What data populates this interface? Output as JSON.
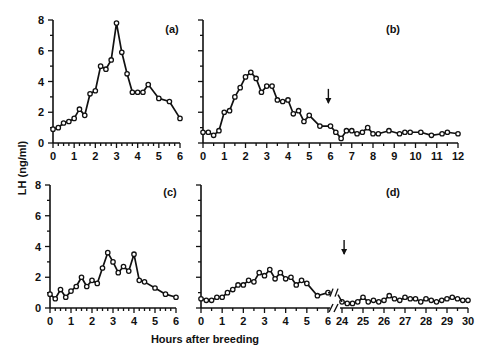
{
  "figure": {
    "ylabel": "LH (ng/ml)",
    "xlabel": "Hours after breeding"
  },
  "chart_data": [
    {
      "panel": "(a)",
      "type": "line",
      "title": "(a)",
      "xlabel": "Hours after breeding",
      "ylabel": "LH (ng/ml)",
      "xlim": [
        0,
        6
      ],
      "ylim": [
        0,
        8
      ],
      "xticks": [
        0,
        1,
        2,
        3,
        4,
        5,
        6
      ],
      "yticks": [
        0,
        2,
        4,
        6,
        8
      ],
      "x": [
        0,
        0.25,
        0.5,
        0.75,
        1,
        1.25,
        1.5,
        1.75,
        2,
        2.25,
        2.5,
        2.75,
        3,
        3.25,
        3.5,
        3.75,
        4,
        4.25,
        4.5,
        5,
        5.5,
        6
      ],
      "y": [
        0.9,
        1.0,
        1.3,
        1.4,
        1.6,
        2.2,
        1.8,
        3.2,
        3.4,
        5.0,
        4.8,
        5.4,
        7.8,
        5.9,
        4.5,
        3.3,
        3.3,
        3.3,
        3.8,
        2.9,
        2.7,
        1.6
      ]
    },
    {
      "panel": "(b)",
      "type": "line",
      "title": "(b)",
      "xlabel": "Hours after breeding",
      "ylabel": "LH (ng/ml)",
      "xlim": [
        0,
        12
      ],
      "ylim": [
        0,
        8
      ],
      "xticks": [
        0,
        1,
        2,
        3,
        4,
        5,
        6,
        7,
        8,
        9,
        10,
        11,
        12
      ],
      "yticks": [
        0,
        2,
        4,
        6,
        8
      ],
      "annotations": [
        {
          "type": "arrow-down",
          "x": 5.9,
          "y": 3.0
        }
      ],
      "x": [
        0,
        0.25,
        0.5,
        0.75,
        1,
        1.25,
        1.5,
        1.75,
        2,
        2.25,
        2.5,
        2.75,
        3,
        3.25,
        3.5,
        3.75,
        4,
        4.25,
        4.5,
        4.75,
        5,
        5.5,
        6,
        6.25,
        6.5,
        6.75,
        7,
        7.25,
        7.5,
        7.75,
        8,
        8.25,
        8.75,
        9.25,
        9.5,
        9.75,
        10.25,
        10.75,
        11.25,
        11.5,
        12
      ],
      "y": [
        0.7,
        0.7,
        0.5,
        0.8,
        2.0,
        2.1,
        3.0,
        3.6,
        4.3,
        4.6,
        4.2,
        3.3,
        3.7,
        3.7,
        2.8,
        2.7,
        2.8,
        1.9,
        2.1,
        1.4,
        1.8,
        1.1,
        1.1,
        0.7,
        0.3,
        0.8,
        0.8,
        0.6,
        0.7,
        1.0,
        0.6,
        0.6,
        0.8,
        0.6,
        0.7,
        0.7,
        0.7,
        0.5,
        0.6,
        0.7,
        0.6
      ]
    },
    {
      "panel": "(c)",
      "type": "line",
      "title": "(c)",
      "xlabel": "Hours after breeding",
      "ylabel": "LH (ng/ml)",
      "xlim": [
        0,
        6
      ],
      "ylim": [
        0,
        8
      ],
      "xticks": [
        0,
        1,
        2,
        3,
        4,
        5,
        6
      ],
      "yticks": [
        0,
        2,
        4,
        6,
        8
      ],
      "x": [
        0,
        0.25,
        0.5,
        0.75,
        1,
        1.25,
        1.5,
        1.75,
        2,
        2.25,
        2.5,
        2.75,
        3,
        3.25,
        3.5,
        3.75,
        4,
        4.25,
        4.5,
        5,
        5.5,
        6
      ],
      "y": [
        0.9,
        0.6,
        1.2,
        0.7,
        1.1,
        1.4,
        2.0,
        1.4,
        1.8,
        1.6,
        2.6,
        3.6,
        3.0,
        2.3,
        2.7,
        2.4,
        3.5,
        1.8,
        1.7,
        1.3,
        0.9,
        0.7
      ]
    },
    {
      "panel": "(d)",
      "type": "line",
      "title": "(d)",
      "xlabel": "Hours after breeding",
      "ylabel": "LH (ng/ml)",
      "xlim": [
        0,
        30
      ],
      "axis_break": [
        6,
        24
      ],
      "ylim": [
        0,
        8
      ],
      "xticks": [
        0,
        1,
        2,
        3,
        4,
        5,
        6,
        24,
        25,
        26,
        27,
        28,
        29,
        30
      ],
      "yticks": [
        0,
        2,
        4,
        6,
        8
      ],
      "annotations": [
        {
          "type": "arrow-down",
          "x": 24.1,
          "y": 3.9
        }
      ],
      "segments": [
        {
          "x": [
            0,
            0.25,
            0.5,
            0.75,
            1,
            1.25,
            1.5,
            1.75,
            2,
            2.25,
            2.5,
            2.75,
            3,
            3.25,
            3.5,
            3.75,
            4,
            4.25,
            4.5,
            4.75,
            5,
            5.5,
            6
          ],
          "y": [
            0.6,
            0.5,
            0.5,
            0.7,
            0.7,
            1.0,
            1.2,
            1.5,
            1.5,
            1.8,
            1.7,
            2.3,
            2.1,
            2.5,
            1.9,
            2.3,
            1.9,
            2.0,
            1.5,
            1.8,
            1.6,
            0.8,
            1.0
          ]
        },
        {
          "x": [
            24,
            24.25,
            24.5,
            24.75,
            25,
            25.25,
            25.5,
            25.75,
            26,
            26.25,
            26.5,
            26.75,
            27,
            27.25,
            27.5,
            27.75,
            28,
            28.25,
            28.5,
            28.75,
            29,
            29.25,
            29.5,
            29.75,
            30
          ],
          "y": [
            0.4,
            0.3,
            0.3,
            0.4,
            0.7,
            0.4,
            0.5,
            0.4,
            0.5,
            0.8,
            0.6,
            0.5,
            0.7,
            0.6,
            0.6,
            0.4,
            0.6,
            0.5,
            0.4,
            0.5,
            0.6,
            0.7,
            0.6,
            0.5,
            0.5
          ]
        }
      ]
    }
  ]
}
